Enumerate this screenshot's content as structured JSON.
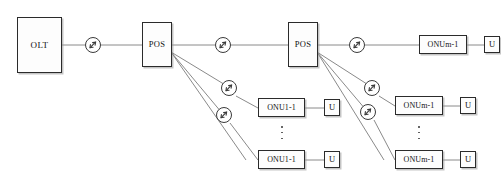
{
  "diagram": {
    "colors": {
      "line": "#8a8a8a",
      "box_border": "#2b2b2b",
      "box_fill": "#fdfdfd",
      "text": "#111111",
      "shadow": "#969696",
      "background": "#ffffff"
    },
    "nodes": {
      "olt": {
        "label": "OLT"
      },
      "pos_left": {
        "label": "POS"
      },
      "pos_right": {
        "label": "POS"
      },
      "onu_left_mid": {
        "label": "ONU1-1"
      },
      "onu_left_bottom": {
        "label": "ONU1-1"
      },
      "onu_right_top": {
        "label": "ONUm-1"
      },
      "onu_right_mid": {
        "label": "ONUm-1"
      },
      "onu_right_bottom": {
        "label": "ONUm-1"
      },
      "u_right_top": {
        "label": "U"
      },
      "u_left_mid": {
        "label": "U"
      },
      "u_left_bottom": {
        "label": "U"
      },
      "u_right_mid": {
        "label": "U"
      },
      "u_right_bottom": {
        "label": "U"
      }
    },
    "icons": {
      "splice": "fiber-splice-icon",
      "ellipsis": "vertical-ellipsis"
    },
    "splice_count": 8,
    "ellipsis_count": 2
  }
}
